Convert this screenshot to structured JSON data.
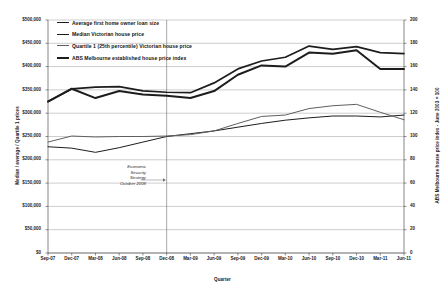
{
  "chart_data": {
    "type": "line",
    "title": "",
    "xlabel": "Quarter",
    "ylabel": "Median / average / Quartile 1 prices",
    "ylabel_right": "ABS Melbourne house price index - June 2003 = 100",
    "categories": [
      "Sep-07",
      "Dec-07",
      "Mar-08",
      "Jun-08",
      "Sep-08",
      "Dec-08",
      "Mar-09",
      "Jun-09",
      "Sep-09",
      "Dec-09",
      "Mar-10",
      "Jun-10",
      "Sep-10",
      "Dec-10",
      "Mar-11",
      "Jun-11"
    ],
    "ylim": [
      0,
      500000
    ],
    "yticks": [
      "$0",
      "$50,000",
      "$100,000",
      "$150,000",
      "$200,000",
      "$250,000",
      "$300,000",
      "$350,000",
      "$400,000",
      "$450,000",
      "$500,000"
    ],
    "ytick_values": [
      0,
      50000,
      100000,
      150000,
      200000,
      250000,
      300000,
      350000,
      400000,
      450000,
      500000
    ],
    "ylim_right": [
      0,
      200
    ],
    "yticks_right": [
      "0",
      "20",
      "40",
      "60",
      "80",
      "100",
      "120",
      "140",
      "160",
      "180",
      "200"
    ],
    "ytick_values_right": [
      0,
      20,
      40,
      60,
      80,
      100,
      120,
      140,
      160,
      180,
      200
    ],
    "grid": true,
    "legend_position": "top-left",
    "series": [
      {
        "name": "Average first home owner loan size",
        "axis": "left",
        "color": "#1d1d1d",
        "width": 1.0,
        "values": [
          228000,
          225000,
          216000,
          226000,
          238000,
          250000,
          256000,
          262000,
          270000,
          278000,
          285000,
          290000,
          294000,
          294000,
          292000,
          296000
        ]
      },
      {
        "name": "Median Victorian house price",
        "axis": "left",
        "color": "#1d1d1d",
        "width": 1.7,
        "values": [
          325000,
          352000,
          356000,
          357000,
          348000,
          345000,
          344000,
          365000,
          395000,
          412000,
          420000,
          444000,
          437000,
          443000,
          430000,
          428000
        ]
      },
      {
        "name": "Quartile 1 (25th percentile) Victorian house price",
        "axis": "left",
        "color": "#5f5f5f",
        "width": 1.0,
        "values": [
          238000,
          251000,
          249000,
          250000,
          250000,
          251000,
          254000,
          262000,
          278000,
          293000,
          296000,
          310000,
          316000,
          319000,
          302000,
          286000
        ]
      },
      {
        "name": "ABS Melbourne established house price index",
        "axis": "right",
        "color": "#1d1d1d",
        "width": 2.0,
        "values": [
          130,
          141,
          133,
          139,
          136,
          135,
          133,
          139,
          153,
          161,
          160,
          172,
          171,
          174,
          158,
          158
        ]
      }
    ],
    "annotation": {
      "lines": [
        "Economic",
        "Security",
        "Strategy",
        "October 2008"
      ],
      "marker_quarter": "Dec-08"
    }
  }
}
